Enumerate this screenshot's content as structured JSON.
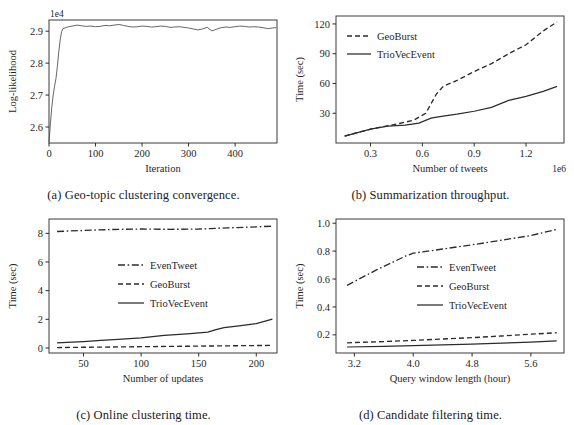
{
  "figure": {
    "panels": [
      "a",
      "b",
      "c",
      "d"
    ]
  },
  "panel_a": {
    "caption": "(a) Geo-topic clustering convergence.",
    "xlabel": "Iteration",
    "ylabel": "Log-likelihood",
    "y_exponent": "1e4",
    "xticks": [
      "0",
      "100",
      "200",
      "300",
      "400"
    ],
    "yticks": [
      "2.6",
      "2.7",
      "2.8",
      "2.9"
    ]
  },
  "panel_b": {
    "caption": "(b) Summarization throughput.",
    "xlabel": "Number of tweets",
    "ylabel": "Time (sec)",
    "x_exponent": "1e6",
    "xticks": [
      "0.3",
      "0.6",
      "0.9",
      "1.2"
    ],
    "yticks": [
      "30",
      "60",
      "90",
      "120"
    ],
    "legend": [
      {
        "label": "GeoBurst",
        "style": "dashed"
      },
      {
        "label": "TrioVecEvent",
        "style": "solid"
      }
    ]
  },
  "panel_c": {
    "caption": "(c) Online clustering time.",
    "xlabel": "Number of updates",
    "ylabel": "Time (sec)",
    "xticks": [
      "50",
      "100",
      "150",
      "200"
    ],
    "yticks": [
      "0",
      "2",
      "4",
      "6",
      "8"
    ],
    "legend": [
      {
        "label": "EvenTweet",
        "style": "dashdot"
      },
      {
        "label": "GeoBurst",
        "style": "dashed"
      },
      {
        "label": "TrioVecEvent",
        "style": "solid"
      }
    ]
  },
  "panel_d": {
    "caption": "(d) Candidate filtering time.",
    "xlabel": "Query window length (hour)",
    "ylabel": "Time (sec)",
    "xticks": [
      "3.2",
      "4.0",
      "4.8",
      "5.6"
    ],
    "yticks": [
      "0.2",
      "0.4",
      "0.6",
      "0.8",
      "1.0"
    ],
    "legend": [
      {
        "label": "EvenTweet",
        "style": "dashdot"
      },
      {
        "label": "GeoBurst",
        "style": "dashed"
      },
      {
        "label": "TrioVecEvent",
        "style": "solid"
      }
    ]
  },
  "chart_data": [
    {
      "panel": "a",
      "type": "line",
      "title": "Geo-topic clustering convergence",
      "xlabel": "Iteration",
      "ylabel": "Log-likelihood",
      "y_scale_factor": 10000,
      "y_exponent_label": "1e4",
      "xlim": [
        0,
        490
      ],
      "ylim": [
        2.55,
        2.935
      ],
      "xticks": [
        0,
        100,
        200,
        300,
        400
      ],
      "yticks": [
        2.6,
        2.7,
        2.8,
        2.9
      ],
      "grid": false,
      "legend": "none",
      "series": [
        {
          "name": "Log-likelihood",
          "style": "solid",
          "x": [
            0,
            3,
            6,
            9,
            12,
            15,
            18,
            21,
            24,
            27,
            30,
            36,
            42,
            50,
            60,
            70,
            80,
            90,
            100,
            110,
            120,
            130,
            140,
            150,
            160,
            170,
            180,
            190,
            200,
            210,
            220,
            230,
            240,
            250,
            260,
            270,
            280,
            290,
            300,
            310,
            320,
            330,
            340,
            350,
            360,
            370,
            380,
            390,
            400,
            410,
            420,
            430,
            440,
            450,
            460,
            470,
            480,
            488
          ],
          "y": [
            2.552,
            2.61,
            2.662,
            2.7,
            2.728,
            2.752,
            2.79,
            2.835,
            2.872,
            2.898,
            2.908,
            2.911,
            2.914,
            2.916,
            2.919,
            2.917,
            2.915,
            2.916,
            2.914,
            2.915,
            2.918,
            2.917,
            2.919,
            2.921,
            2.918,
            2.915,
            2.913,
            2.914,
            2.916,
            2.915,
            2.913,
            2.914,
            2.916,
            2.915,
            2.912,
            2.913,
            2.914,
            2.912,
            2.91,
            2.907,
            2.904,
            2.907,
            2.912,
            2.901,
            2.906,
            2.911,
            2.913,
            2.912,
            2.914,
            2.916,
            2.915,
            2.913,
            2.914,
            2.913,
            2.911,
            2.908,
            2.91,
            2.911
          ]
        }
      ]
    },
    {
      "panel": "b",
      "type": "line",
      "title": "Summarization throughput",
      "xlabel": "Number of tweets",
      "ylabel": "Time (sec)",
      "x_scale_factor": 1000000,
      "x_exponent_label": "1e6",
      "xlim": [
        0.1,
        1.42
      ],
      "ylim": [
        0,
        128
      ],
      "xticks": [
        0.3,
        0.6,
        0.9,
        1.2
      ],
      "yticks": [
        30,
        60,
        90,
        120
      ],
      "grid": false,
      "legend": "upper left",
      "series": [
        {
          "name": "GeoBurst",
          "style": "dashed",
          "x": [
            0.15,
            0.3,
            0.45,
            0.55,
            0.62,
            0.68,
            0.72,
            0.8,
            0.9,
            1.0,
            1.1,
            1.2,
            1.3,
            1.38
          ],
          "y": [
            7,
            14,
            19,
            23,
            30,
            49,
            57,
            63,
            72,
            80,
            90,
            99,
            113,
            122
          ]
        },
        {
          "name": "TrioVecEvent",
          "style": "solid",
          "x": [
            0.15,
            0.3,
            0.4,
            0.5,
            0.58,
            0.65,
            0.72,
            0.8,
            0.9,
            1.0,
            1.1,
            1.2,
            1.3,
            1.38
          ],
          "y": [
            7,
            14,
            17,
            18,
            20,
            25,
            27,
            29,
            32,
            36,
            43,
            47,
            52,
            57
          ]
        }
      ]
    },
    {
      "panel": "c",
      "type": "line",
      "title": "Online clustering time",
      "xlabel": "Number of updates",
      "ylabel": "Time (sec)",
      "xlim": [
        20,
        218
      ],
      "ylim": [
        -0.35,
        9.0
      ],
      "xticks": [
        50,
        100,
        150,
        200
      ],
      "yticks": [
        0,
        2,
        4,
        6,
        8
      ],
      "grid": false,
      "legend": "center right",
      "series": [
        {
          "name": "EvenTweet",
          "style": "dashdot",
          "x": [
            27,
            50,
            75,
            100,
            125,
            150,
            160,
            175,
            200,
            214
          ],
          "y": [
            8.13,
            8.2,
            8.27,
            8.3,
            8.28,
            8.3,
            8.33,
            8.38,
            8.45,
            8.5
          ]
        },
        {
          "name": "GeoBurst",
          "style": "dashed",
          "x": [
            27,
            50,
            75,
            100,
            125,
            150,
            175,
            200,
            214
          ],
          "y": [
            0.03,
            0.05,
            0.07,
            0.09,
            0.11,
            0.13,
            0.15,
            0.17,
            0.18
          ]
        },
        {
          "name": "TrioVecEvent",
          "style": "solid",
          "x": [
            27,
            40,
            50,
            65,
            80,
            100,
            120,
            140,
            158,
            165,
            172,
            185,
            200,
            214
          ],
          "y": [
            0.36,
            0.41,
            0.45,
            0.53,
            0.6,
            0.7,
            0.88,
            0.98,
            1.1,
            1.28,
            1.42,
            1.55,
            1.7,
            2.02
          ]
        }
      ]
    },
    {
      "panel": "d",
      "type": "line",
      "title": "Candidate filtering time",
      "xlabel": "Query window length (hour)",
      "ylabel": "Time (sec)",
      "xlim": [
        2.95,
        6.05
      ],
      "ylim": [
        0.07,
        1.03
      ],
      "xticks": [
        3.2,
        4.0,
        4.8,
        5.6
      ],
      "yticks": [
        0.2,
        0.4,
        0.6,
        0.8,
        1.0
      ],
      "grid": false,
      "legend": "center right",
      "series": [
        {
          "name": "EvenTweet",
          "style": "dashdot",
          "x": [
            3.1,
            3.5,
            3.9,
            4.0,
            4.4,
            4.8,
            5.2,
            5.6,
            5.95
          ],
          "y": [
            0.555,
            0.665,
            0.765,
            0.785,
            0.815,
            0.845,
            0.878,
            0.912,
            0.955
          ]
        },
        {
          "name": "GeoBurst",
          "style": "dashed",
          "x": [
            3.1,
            3.6,
            4.0,
            4.4,
            4.8,
            5.2,
            5.6,
            5.95
          ],
          "y": [
            0.143,
            0.152,
            0.16,
            0.17,
            0.18,
            0.192,
            0.205,
            0.215
          ]
        },
        {
          "name": "TrioVecEvent",
          "style": "solid",
          "x": [
            3.1,
            3.6,
            4.0,
            4.4,
            4.8,
            5.2,
            5.6,
            5.95
          ],
          "y": [
            0.113,
            0.118,
            0.122,
            0.128,
            0.133,
            0.14,
            0.148,
            0.157
          ]
        }
      ]
    }
  ]
}
